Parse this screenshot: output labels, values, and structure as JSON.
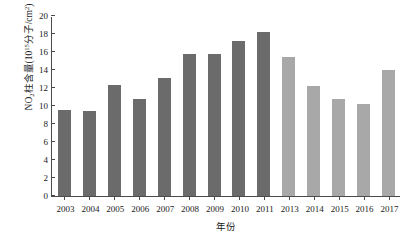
{
  "chart_data": {
    "type": "bar",
    "title": "",
    "xlabel": "年份",
    "ylabel_html": "NO<sub>2</sub>柱含量(10<sup>15</sup>分子/cm<sup>2</sup>)",
    "ylabel_plain": "NO2柱含量(10^15分子/cm^2)",
    "categories": [
      "2003",
      "2004",
      "2005",
      "2006",
      "2007",
      "2008",
      "2009",
      "2010",
      "2011",
      "2013",
      "2014",
      "2015",
      "2016",
      "2017"
    ],
    "values": [
      9.6,
      9.4,
      12.3,
      10.8,
      13.1,
      15.8,
      15.8,
      17.2,
      18.2,
      15.4,
      12.2,
      10.8,
      10.2,
      14.0
    ],
    "bar_colors": [
      "#6b6b6b",
      "#6b6b6b",
      "#6b6b6b",
      "#6b6b6b",
      "#6b6b6b",
      "#6b6b6b",
      "#6b6b6b",
      "#6b6b6b",
      "#6b6b6b",
      "#a8a8a8",
      "#a8a8a8",
      "#a8a8a8",
      "#a8a8a8",
      "#a8a8a8"
    ],
    "ylim": [
      0,
      20
    ],
    "yticks": [
      0,
      2,
      4,
      6,
      8,
      10,
      12,
      14,
      16,
      18,
      20
    ],
    "ytick_labels": [
      "0",
      "2",
      "4",
      "6",
      "8",
      "10",
      "12",
      "14",
      "16",
      "18",
      "20"
    ],
    "grid": false,
    "legend": null,
    "axis_color": "#4a4a4a",
    "bar_color_dark": "#6b6b6b",
    "bar_color_light": "#a8a8a8"
  }
}
